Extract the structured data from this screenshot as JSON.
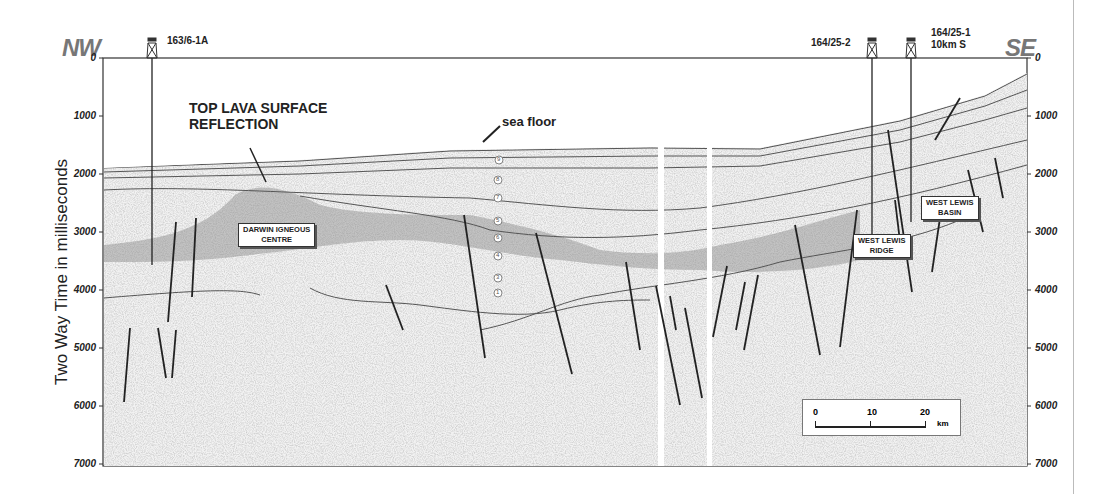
{
  "figure": {
    "direction_left": "NW",
    "direction_right": "SE",
    "y_axis_label": "Two Way Time in milliseconds",
    "y_ticks": [
      "0",
      "1000",
      "2000",
      "3000",
      "4000",
      "5000",
      "6000",
      "7000"
    ],
    "wells": [
      {
        "name": "163/6-1A",
        "sub": ""
      },
      {
        "name": "164/25-2",
        "sub": ""
      },
      {
        "name": "164/25-1",
        "sub": "10km S"
      }
    ],
    "annotations": {
      "top_lava_line1": "TOP LAVA SURFACE",
      "top_lava_line2": "REFLECTION",
      "sea_floor": "sea floor"
    },
    "boxes": {
      "darwin_line1": "DARWIN  IGNEOUS",
      "darwin_line2": "CENTRE",
      "ridge_line1": "WEST  LEWIS",
      "ridge_line2": "RIDGE",
      "basin_line1": "WEST  LEWIS",
      "basin_line2": "BASIN"
    },
    "horizon_markers": [
      "9",
      "8",
      "7",
      "5",
      "6",
      "4",
      "3",
      "1"
    ],
    "scale_bar": {
      "ticks": [
        "0",
        "10",
        "20"
      ],
      "unit": "km"
    }
  }
}
